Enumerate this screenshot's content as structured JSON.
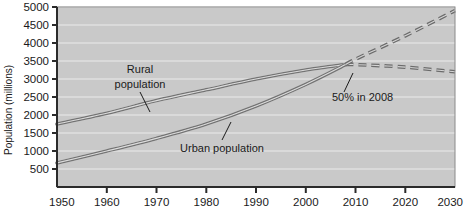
{
  "figure": {
    "background_color": "#ffffff",
    "plot_background_color": "#c9c9c9",
    "gridline_color": "#e4e4e4",
    "axis_color": "#2b2b2b",
    "series_color": "#6b6b6b"
  },
  "axes": {
    "ylabel": "Population (millions)",
    "yticks": [
      "500",
      "1000",
      "1500",
      "2000",
      "2500",
      "3000",
      "3500",
      "4000",
      "4500",
      "5000"
    ],
    "xticks": [
      "1950",
      "1960",
      "1970",
      "1980",
      "1990",
      "2000",
      "2010",
      "2020",
      "2030"
    ]
  },
  "annotations": {
    "rural_label_line1": "Rural",
    "rural_label_line2": "population",
    "urban_label": "Urban population",
    "crossover_label": "50% in 2008"
  },
  "chart_data": {
    "type": "line",
    "title": "",
    "xlabel": "",
    "ylabel": "Population (millions)",
    "xlim": [
      1950,
      2030
    ],
    "ylim": [
      0,
      5000
    ],
    "xticks": [
      1950,
      1960,
      1970,
      1980,
      1990,
      2000,
      2010,
      2020,
      2030
    ],
    "yticks": [
      500,
      1000,
      1500,
      2000,
      2500,
      3000,
      3500,
      4000,
      4500,
      5000
    ],
    "grid": true,
    "legend": "none (inline annotations)",
    "annotations": [
      {
        "text": "Rural population",
        "x": 1965,
        "y": 3000
      },
      {
        "text": "Urban population",
        "x": 1985,
        "y": 1250
      },
      {
        "text": "50% in 2008",
        "x": 2008,
        "y": 3400
      }
    ],
    "series": [
      {
        "name": "Rural population",
        "style_solid_until": 2008,
        "style_dashed_after": 2008,
        "x": [
          1950,
          1960,
          1970,
          1980,
          1990,
          2000,
          2008,
          2010,
          2020,
          2030
        ],
        "values": [
          1750,
          2050,
          2400,
          2700,
          3000,
          3250,
          3400,
          3400,
          3330,
          3200
        ]
      },
      {
        "name": "Urban population",
        "style_solid_until": 2008,
        "style_dashed_after": 2008,
        "x": [
          1950,
          1960,
          1970,
          1980,
          1990,
          2000,
          2008,
          2010,
          2020,
          2030
        ],
        "values": [
          670,
          1000,
          1350,
          1750,
          2250,
          2850,
          3400,
          3550,
          4200,
          4900
        ]
      }
    ]
  }
}
